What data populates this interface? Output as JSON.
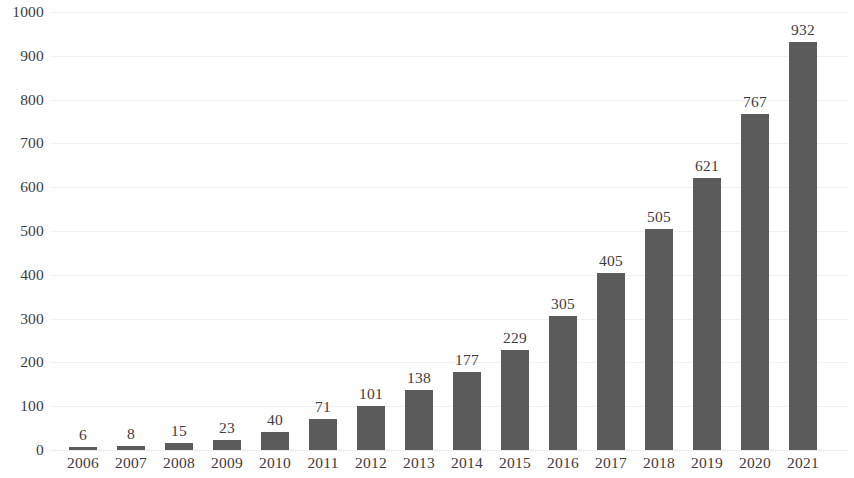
{
  "chart_data": {
    "type": "bar",
    "title": "",
    "subtitle": "",
    "xlabel": "",
    "ylabel": "",
    "categories": [
      "2006",
      "2007",
      "2008",
      "2009",
      "2010",
      "2011",
      "2012",
      "2013",
      "2014",
      "2015",
      "2016",
      "2017",
      "2018",
      "2019",
      "2020",
      "2021"
    ],
    "values": [
      6,
      8,
      15,
      23,
      40,
      71,
      101,
      138,
      177,
      229,
      305,
      405,
      505,
      621,
      767,
      932
    ],
    "data_labels": [
      "6",
      "8",
      "15",
      "23",
      "40",
      "71",
      "101",
      "138",
      "177",
      "229",
      "305",
      "405",
      "505",
      "621",
      "767",
      "932"
    ],
    "ylim": [
      0,
      1000
    ],
    "ytick_values": [
      0,
      100,
      200,
      300,
      400,
      500,
      600,
      700,
      800,
      900,
      1000
    ],
    "ytick_labels": [
      "0",
      "100",
      "200",
      "300",
      "400",
      "500",
      "600",
      "700",
      "800",
      "900",
      "1000"
    ],
    "grid": true,
    "grid_axis": "y",
    "legend": false,
    "legend_position": "none",
    "annotations": [],
    "series": [
      {
        "name": "",
        "values": [
          6,
          8,
          15,
          23,
          40,
          71,
          101,
          138,
          177,
          229,
          305,
          405,
          505,
          621,
          767,
          932
        ]
      }
    ]
  },
  "style": {
    "bar_color": "#5b5b5b",
    "grid_color": "#f1f1f1",
    "text_color": "#3d3d3d",
    "background_color": "#ffffff"
  }
}
